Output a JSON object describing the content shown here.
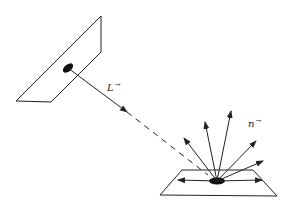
{
  "diagram": {
    "colors": {
      "stroke": "#222222",
      "background": "#ffffff"
    },
    "source_patch": {
      "shape": "parallelogram",
      "points": [
        [
          101,
          16
        ],
        [
          101,
          52
        ],
        [
          51,
          102
        ],
        [
          16,
          101
        ]
      ],
      "spot": {
        "cx": 68,
        "cy": 68,
        "rx": 6,
        "ry": 3.5,
        "rotate": -40
      }
    },
    "incident_vector": {
      "label": "L",
      "arrow_symbol": "→",
      "from": [
        68,
        68
      ],
      "to": [
        127,
        112
      ],
      "dashed_to": [
        208,
        175
      ]
    },
    "surface_patch": {
      "shape": "trapezoid",
      "points": [
        [
          182,
          170
        ],
        [
          253,
          170
        ],
        [
          277,
          196
        ],
        [
          160,
          195
        ]
      ],
      "spot": {
        "cx": 217,
        "cy": 181,
        "rx": 8,
        "ry": 3.5
      }
    },
    "reflection_label": {
      "label": "n",
      "arrow_symbol": "→"
    },
    "reflected_rays": [
      {
        "to": [
          184,
          138
        ]
      },
      {
        "to": [
          205,
          122
        ]
      },
      {
        "to": [
          231,
          111
        ]
      },
      {
        "to": [
          256,
          141
        ]
      },
      {
        "to": [
          263,
          161
        ]
      }
    ],
    "surface_rays": [
      {
        "to": [
          178,
          180
        ]
      },
      {
        "to": [
          262,
          180
        ]
      }
    ]
  }
}
